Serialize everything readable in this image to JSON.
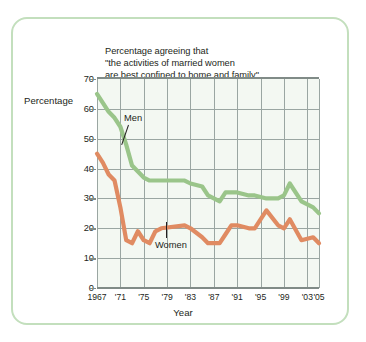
{
  "figure": {
    "title": "Percentage agreeing that\n\"the activities of married women\nare best confined to home and family\"",
    "border_color": "#c3dfbd"
  },
  "chart_data": {
    "type": "line",
    "title": "Percentage agreeing that \"the activities of married women are best confined to home and family\"",
    "xlabel": "Year",
    "ylabel": "Percentage",
    "xlim": [
      1967,
      2005
    ],
    "ylim": [
      0,
      70
    ],
    "grid": true,
    "legend_position": "inline-annotations",
    "ytick_values": [
      0,
      10,
      20,
      30,
      40,
      50,
      60,
      70
    ],
    "xtick_values": [
      1967,
      1971,
      1975,
      1979,
      1983,
      1987,
      1991,
      1995,
      1999,
      2003,
      2005
    ],
    "xtick_labels": [
      "1967",
      "'71",
      "'75",
      "'79",
      "'83",
      "'87",
      "'91",
      "'95",
      "'99",
      "'03",
      "'05"
    ],
    "series": [
      {
        "name": "Men",
        "color": "#9ac58a",
        "x": [
          1967,
          1968,
          1969,
          1970,
          1971,
          1972,
          1973,
          1974,
          1975,
          1976,
          1977,
          1978,
          1982,
          1983,
          1985,
          1986,
          1988,
          1989,
          1990,
          1991,
          1993,
          1994,
          1996,
          1998,
          1999,
          2000,
          2002,
          2004,
          2005
        ],
        "values": [
          65,
          62,
          59,
          57,
          54,
          48,
          41,
          39,
          37,
          36,
          36,
          36,
          36,
          35,
          34,
          31,
          29,
          32,
          32,
          32,
          31,
          31,
          30,
          30,
          31,
          35,
          29,
          27,
          25
        ]
      },
      {
        "name": "Women",
        "color": "#e08b62",
        "x": [
          1967,
          1968,
          1969,
          1970,
          1971,
          1972,
          1973,
          1974,
          1975,
          1976,
          1977,
          1978,
          1982,
          1983,
          1985,
          1986,
          1988,
          1989,
          1990,
          1991,
          1993,
          1994,
          1996,
          1998,
          1999,
          2000,
          2002,
          2004,
          2005
        ],
        "values": [
          45,
          42,
          38,
          36,
          27,
          16,
          15,
          19,
          16,
          15,
          19,
          20,
          21,
          20,
          17,
          15,
          15,
          18,
          21,
          21,
          20,
          20,
          26,
          21,
          20,
          23,
          16,
          17,
          15
        ]
      }
    ],
    "annotations": [
      {
        "text": "Men",
        "series": "Men"
      },
      {
        "text": "Women",
        "series": "Women"
      }
    ]
  }
}
